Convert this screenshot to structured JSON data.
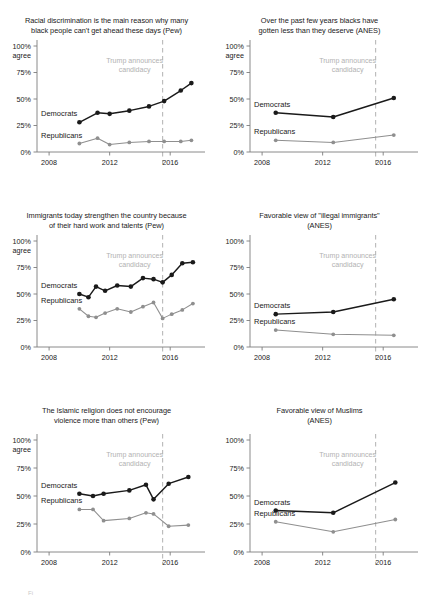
{
  "figure": {
    "background": "#ffffff",
    "dem_color": "#1a1a1a",
    "rep_color": "#8f8f8f",
    "event_color": "#b2b2b2",
    "axis_color": "#7d7d7d",
    "bottom_stub": "Fi"
  },
  "common": {
    "y_ticks": [
      "100%",
      "75%",
      "50%",
      "25%",
      "0%"
    ],
    "y_values": [
      100,
      75,
      50,
      25,
      0
    ],
    "y_unit_label": "agree",
    "x_ticks": [
      "2008",
      "2012",
      "2016"
    ],
    "x_tick_values": [
      2008,
      2012,
      2016
    ],
    "event_label_line1": "Trump announces",
    "event_label_line2": "candidacy",
    "event_year": 2015.5,
    "dem_label": "Democrats",
    "rep_label": "Republicans",
    "xlim": [
      2007.2,
      2018.3
    ],
    "ylim": [
      0,
      100
    ]
  },
  "chart_data": [
    {
      "id": "racial-discrimination",
      "type": "line",
      "title": "Racial discrimination is the main reason why many black people can't get ahead these days (Pew)",
      "title_line1": "Racial discrimination is the main reason why many",
      "title_line2": "black people can't get ahead these days (Pew)",
      "source": "Pew",
      "ylabel": "100% agree",
      "xlabel": "",
      "show_agree_label": true,
      "ylim": [
        0,
        100
      ],
      "xlim": [
        2007.2,
        2018.3
      ],
      "grid": false,
      "legend_position": "inline",
      "annotations": [
        {
          "text": "Trump announces candidacy",
          "x": 2015.5,
          "type": "vline-dashed"
        }
      ],
      "series": [
        {
          "name": "Democrats",
          "color": "#1a1a1a",
          "x": [
            2010,
            2011.2,
            2012,
            2013.3,
            2014.6,
            2015.6,
            2016.7,
            2017.4
          ],
          "values": [
            28,
            37,
            36,
            39,
            43,
            48,
            58,
            65
          ]
        },
        {
          "name": "Republicans",
          "color": "#8f8f8f",
          "x": [
            2010,
            2011.2,
            2012,
            2013.3,
            2014.6,
            2015.6,
            2016.7,
            2017.4
          ],
          "values": [
            8,
            13,
            7,
            9,
            10,
            10,
            10,
            11
          ]
        }
      ]
    },
    {
      "id": "blacks-gotten-less",
      "type": "line",
      "title": "Over the past few years blacks have gotten less than they deserve (ANES)",
      "title_line1": "Over the past few years blacks have",
      "title_line2": "gotten less than they deserve (ANES)",
      "source": "ANES",
      "ylabel": "100% agree",
      "xlabel": "",
      "show_agree_label": true,
      "ylim": [
        0,
        100
      ],
      "xlim": [
        2007.2,
        2018.3
      ],
      "grid": false,
      "legend_position": "inline",
      "annotations": [
        {
          "text": "Trump announces candidacy",
          "x": 2015.5,
          "type": "vline-dashed"
        }
      ],
      "series": [
        {
          "name": "Democrats",
          "color": "#1a1a1a",
          "x": [
            2008.9,
            2012.7,
            2016.7
          ],
          "values": [
            37,
            33,
            51
          ]
        },
        {
          "name": "Republicans",
          "color": "#8f8f8f",
          "x": [
            2008.9,
            2012.7,
            2016.7
          ],
          "values": [
            11,
            9,
            16
          ]
        }
      ]
    },
    {
      "id": "immigrants-strengthen",
      "type": "line",
      "title": "Immigrants today strengthen the country because of their hard work and talents (Pew)",
      "title_line1": "Immigrants today strengthen the country because",
      "title_line2": "of their hard work and talents (Pew)",
      "source": "Pew",
      "ylabel": "100% agree",
      "xlabel": "",
      "show_agree_label": true,
      "ylim": [
        0,
        100
      ],
      "xlim": [
        2007.2,
        2018.3
      ],
      "grid": false,
      "legend_position": "inline",
      "annotations": [
        {
          "text": "Trump announces candidacy",
          "x": 2015.5,
          "type": "vline-dashed"
        }
      ],
      "series": [
        {
          "name": "Democrats",
          "color": "#1a1a1a",
          "x": [
            2010.0,
            2010.6,
            2011.1,
            2011.7,
            2012.5,
            2013.4,
            2014.2,
            2014.9,
            2015.5,
            2016.1,
            2016.8,
            2017.5
          ],
          "values": [
            50,
            47,
            57,
            53,
            58,
            57,
            65,
            64,
            61,
            68,
            79,
            80
          ]
        },
        {
          "name": "Republicans",
          "color": "#8f8f8f",
          "x": [
            2010.0,
            2010.6,
            2011.1,
            2011.7,
            2012.5,
            2013.4,
            2014.2,
            2014.9,
            2015.5,
            2016.1,
            2016.8,
            2017.5
          ],
          "values": [
            36,
            29,
            28,
            32,
            36,
            33,
            38,
            42,
            27,
            31,
            35,
            41
          ]
        }
      ]
    },
    {
      "id": "favorable-illegal-immigrants",
      "type": "line",
      "title": "Favorable view of \"illegal immigrants\" (ANES)",
      "title_line1": "Favorable view of \"illegal immigrants\"",
      "title_line2": "(ANES)",
      "source": "ANES",
      "ylabel": "100%",
      "xlabel": "",
      "show_agree_label": false,
      "ylim": [
        0,
        100
      ],
      "xlim": [
        2007.2,
        2018.3
      ],
      "grid": false,
      "legend_position": "inline",
      "annotations": [
        {
          "text": "Trump announces candidacy",
          "x": 2015.5,
          "type": "vline-dashed"
        }
      ],
      "series": [
        {
          "name": "Democrats",
          "color": "#1a1a1a",
          "x": [
            2008.9,
            2012.7,
            2016.7
          ],
          "values": [
            31,
            33,
            45
          ]
        },
        {
          "name": "Republicans",
          "color": "#8f8f8f",
          "x": [
            2008.9,
            2012.7,
            2016.7
          ],
          "values": [
            16,
            12,
            11
          ]
        }
      ]
    },
    {
      "id": "islamic-religion-violence",
      "type": "line",
      "title": "The Islamic religion does not encourage violence more than others (Pew)",
      "title_line1": "The Islamic religion does not encourage",
      "title_line2": "violence more than others (Pew)",
      "source": "Pew",
      "ylabel": "100% agree",
      "xlabel": "",
      "show_agree_label": true,
      "ylim": [
        0,
        100
      ],
      "xlim": [
        2007.2,
        2018.3
      ],
      "grid": false,
      "legend_position": "inline",
      "annotations": [
        {
          "text": "Trump announces candidacy",
          "x": 2015.5,
          "type": "vline-dashed"
        }
      ],
      "series": [
        {
          "name": "Democrats",
          "color": "#1a1a1a",
          "x": [
            2010.0,
            2010.9,
            2011.6,
            2013.3,
            2014.4,
            2014.9,
            2015.9,
            2017.2
          ],
          "values": [
            52,
            50,
            52,
            55,
            60,
            47,
            61,
            67
          ]
        },
        {
          "name": "Republicans",
          "color": "#8f8f8f",
          "x": [
            2010.0,
            2010.9,
            2011.6,
            2013.3,
            2014.4,
            2014.9,
            2015.9,
            2017.2
          ],
          "values": [
            38,
            38,
            28,
            30,
            35,
            34,
            23,
            24,
            25
          ]
        }
      ]
    },
    {
      "id": "favorable-muslims",
      "type": "line",
      "title": "Favorable view of Muslims (ANES)",
      "title_line1": "Favorable view of Muslims",
      "title_line2": "(ANES)",
      "source": "ANES",
      "ylabel": "100%",
      "xlabel": "",
      "show_agree_label": false,
      "ylim": [
        0,
        100
      ],
      "xlim": [
        2007.2,
        2018.3
      ],
      "grid": false,
      "legend_position": "inline",
      "annotations": [
        {
          "text": "Trump announces candidacy",
          "x": 2015.5,
          "type": "vline-dashed"
        }
      ],
      "series": [
        {
          "name": "Democrats",
          "color": "#1a1a1a",
          "x": [
            2008.9,
            2012.7,
            2016.8
          ],
          "values": [
            37,
            35,
            62
          ]
        },
        {
          "name": "Republicans",
          "color": "#8f8f8f",
          "x": [
            2008.9,
            2012.7,
            2016.8
          ],
          "values": [
            27,
            18,
            29
          ]
        }
      ]
    }
  ]
}
